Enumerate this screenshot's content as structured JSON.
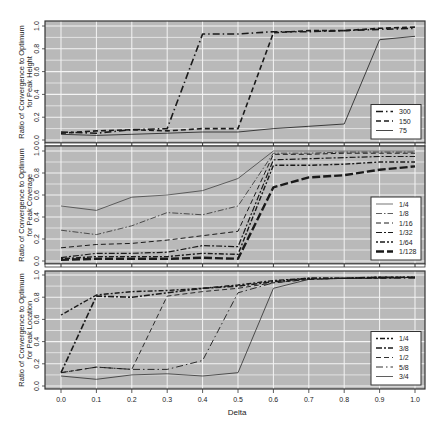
{
  "chart_data": [
    {
      "type": "line",
      "title": "",
      "xlabel": "Delta",
      "ylabel": "Ratio of Convergence to Optimum for Peak Height",
      "ylabel_lines": [
        "Ratio of Convergence to Optimum",
        "for Peak Height"
      ],
      "x": [
        0.0,
        0.1,
        0.2,
        0.3,
        0.4,
        0.5,
        0.6,
        0.7,
        0.8,
        0.9,
        1.0
      ],
      "xlim": [
        0.0,
        1.0
      ],
      "ylim": [
        0.0,
        1.0
      ],
      "yticks": [
        "0.0",
        "0.2",
        "0.4",
        "0.6",
        "0.8",
        "1.0"
      ],
      "grid": true,
      "legend_position": "bottom-right",
      "series": [
        {
          "name": "300",
          "style": "longdash-dot",
          "width": 1.6,
          "values": [
            0.07,
            0.06,
            0.09,
            0.1,
            0.93,
            0.93,
            0.95,
            0.95,
            0.96,
            0.97,
            0.98
          ]
        },
        {
          "name": "150",
          "style": "dashed",
          "width": 1.6,
          "values": [
            0.06,
            0.08,
            0.09,
            0.08,
            0.1,
            0.1,
            0.94,
            0.96,
            0.96,
            0.98,
            0.99
          ]
        },
        {
          "name": "75",
          "style": "solid",
          "width": 0.8,
          "values": [
            0.05,
            0.04,
            0.05,
            0.06,
            0.07,
            0.07,
            0.1,
            0.12,
            0.14,
            0.88,
            0.91
          ]
        }
      ]
    },
    {
      "type": "line",
      "title": "",
      "xlabel": "Delta",
      "ylabel": "Ratio of Convergence to Optimum for Peak Coverage",
      "ylabel_lines": [
        "Ratio of Convergence to Optimum",
        "for Peak Coverage"
      ],
      "x": [
        0.0,
        0.1,
        0.2,
        0.3,
        0.4,
        0.5,
        0.6,
        0.7,
        0.8,
        0.9,
        1.0
      ],
      "xlim": [
        0.0,
        1.0
      ],
      "ylim": [
        0.0,
        1.0
      ],
      "yticks": [
        "0.0",
        "0.2",
        "0.4",
        "0.6",
        "0.8",
        "1.0"
      ],
      "grid": true,
      "legend_position": "bottom-right",
      "series": [
        {
          "name": "1/4",
          "style": "solid",
          "width": 0.6,
          "values": [
            0.5,
            0.46,
            0.58,
            0.6,
            0.64,
            0.75,
            1.0,
            1.0,
            1.0,
            1.0,
            1.0
          ]
        },
        {
          "name": "1/8",
          "style": "dash-dot-thin",
          "width": 0.7,
          "values": [
            0.28,
            0.24,
            0.32,
            0.44,
            0.42,
            0.5,
            0.98,
            0.98,
            0.99,
            0.99,
            0.99
          ]
        },
        {
          "name": "1/16",
          "style": "dashed",
          "width": 1.0,
          "values": [
            0.12,
            0.15,
            0.16,
            0.19,
            0.23,
            0.27,
            0.97,
            0.97,
            0.98,
            0.98,
            0.98
          ]
        },
        {
          "name": "1/32",
          "style": "dash-dot",
          "width": 1.2,
          "values": [
            0.03,
            0.07,
            0.07,
            0.08,
            0.14,
            0.13,
            0.92,
            0.93,
            0.94,
            0.95,
            0.95
          ]
        },
        {
          "name": "1/64",
          "style": "dot-dash",
          "width": 1.4,
          "values": [
            0.02,
            0.04,
            0.04,
            0.04,
            0.07,
            0.06,
            0.87,
            0.87,
            0.88,
            0.9,
            0.9
          ]
        },
        {
          "name": "1/128",
          "style": "longdash-thick",
          "width": 2.4,
          "values": [
            0.01,
            0.02,
            0.02,
            0.02,
            0.03,
            0.02,
            0.67,
            0.76,
            0.78,
            0.83,
            0.86
          ]
        }
      ]
    },
    {
      "type": "line",
      "title": "",
      "xlabel": "Delta",
      "ylabel": "Ratio of Convergence to Optimum for Peak Location",
      "ylabel_lines": [
        "Ratio of Convergence to Optimum",
        "for Peak Location"
      ],
      "x": [
        0.0,
        0.1,
        0.2,
        0.3,
        0.4,
        0.5,
        0.6,
        0.7,
        0.8,
        0.9,
        1.0
      ],
      "xlim": [
        0.0,
        1.0
      ],
      "ylim": [
        0.0,
        1.0
      ],
      "yticks": [
        "0.0",
        "0.2",
        "0.4",
        "0.6",
        "0.8",
        "1.0"
      ],
      "xticks": [
        "0.0",
        "0.1",
        "0.2",
        "0.3",
        "0.4",
        "0.5",
        "0.6",
        "0.7",
        "0.8",
        "0.9",
        "1.0"
      ],
      "grid": true,
      "legend_position": "bottom-right",
      "series": [
        {
          "name": "1/4",
          "style": "dot-dash",
          "width": 1.4,
          "values": [
            0.64,
            0.82,
            0.85,
            0.86,
            0.88,
            0.91,
            0.95,
            0.97,
            0.97,
            0.98,
            0.98
          ]
        },
        {
          "name": "3/8",
          "style": "dash-dot",
          "width": 1.6,
          "values": [
            0.12,
            0.81,
            0.8,
            0.84,
            0.88,
            0.9,
            0.94,
            0.97,
            0.97,
            0.98,
            0.98
          ]
        },
        {
          "name": "1/2",
          "style": "dashed",
          "width": 0.9,
          "values": [
            0.12,
            0.17,
            0.15,
            0.81,
            0.85,
            0.88,
            0.93,
            0.96,
            0.97,
            0.97,
            0.98
          ]
        },
        {
          "name": "5/8",
          "style": "longdash-dot",
          "width": 0.9,
          "values": [
            0.12,
            0.17,
            0.15,
            0.15,
            0.23,
            0.84,
            0.93,
            0.96,
            0.97,
            0.97,
            0.97
          ]
        },
        {
          "name": "3/4",
          "style": "solid",
          "width": 0.7,
          "values": [
            0.09,
            0.06,
            0.1,
            0.11,
            0.09,
            0.12,
            0.88,
            0.96,
            0.97,
            0.97,
            0.98
          ]
        }
      ]
    }
  ],
  "colors": {
    "panel_bg": "#b9b9b9",
    "grid": "#f4f4f4",
    "line": "#1a1a1a",
    "frame": "#333333"
  },
  "figure": {
    "xlabel": "Delta"
  }
}
